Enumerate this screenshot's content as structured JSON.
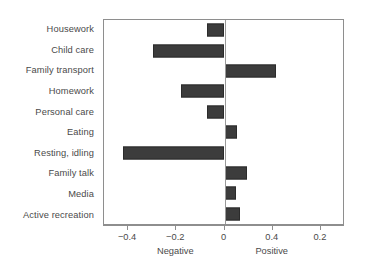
{
  "chart_data": {
    "type": "bar",
    "orientation": "horizontal",
    "title": "",
    "subtitle": "",
    "xlabel": "",
    "ylabel": "",
    "xlim": [
      -0.5,
      0.5
    ],
    "xticks": [
      -0.4,
      -0.2,
      0,
      0.4,
      0.2
    ],
    "xtick_labels": [
      "−0.4",
      "−0.2",
      "0",
      "0.2",
      "0.4"
    ],
    "grid": false,
    "legend": null,
    "zero_reference_line": true,
    "bar_color": "#3c3c3c",
    "axis_color": "#8e8e8e",
    "text_color": "#4a4a4a",
    "annotations": [
      {
        "text": "Negative",
        "at_x": -0.2
      },
      {
        "text": "Positive",
        "at_x": 0.2
      }
    ],
    "categories": [
      "Housework",
      "Child care",
      "Family transport",
      "Homework",
      "Personal care",
      "Eating",
      "Resting, idling",
      "Family talk",
      "Media",
      "Active recreation"
    ],
    "values": [
      -0.073,
      -0.295,
      0.215,
      -0.18,
      -0.072,
      0.05,
      -0.42,
      0.095,
      0.048,
      0.065
    ],
    "points": [
      {
        "category": "Housework",
        "value": -0.073
      },
      {
        "category": "Child care",
        "value": -0.295
      },
      {
        "category": "Family transport",
        "value": 0.215
      },
      {
        "category": "Homework",
        "value": -0.18
      },
      {
        "category": "Personal care",
        "value": -0.072
      },
      {
        "category": "Eating",
        "value": 0.05
      },
      {
        "category": "Resting, idling",
        "value": -0.42
      },
      {
        "category": "Family talk",
        "value": 0.095
      },
      {
        "category": "Media",
        "value": 0.048
      },
      {
        "category": "Active recreation",
        "value": 0.065
      }
    ]
  }
}
